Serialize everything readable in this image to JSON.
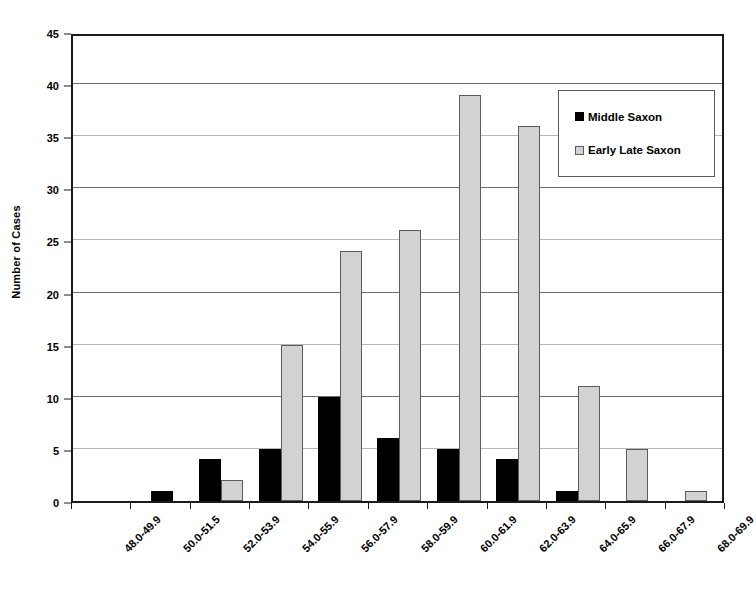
{
  "chart_data": {
    "type": "bar",
    "title": "",
    "xlabel": "",
    "ylabel": "Number of Cases",
    "ylim": [
      0,
      45
    ],
    "ytick_step": 5,
    "yticks": [
      0,
      5,
      10,
      15,
      20,
      25,
      30,
      35,
      40,
      45
    ],
    "grid": true,
    "legend_position": "top-right",
    "categories": [
      "48.0-49.9",
      "50.0-51.5",
      "52.0-53.9",
      "54.0-55.9",
      "56.0-57.9",
      "58.0-59.9",
      "60.0-61.9",
      "62.0-63.9",
      "64.0-65.9",
      "66.0-67.9",
      "68.0-69.9"
    ],
    "series": [
      {
        "name": "Middle Saxon",
        "color": "#000000",
        "values": [
          0,
          1,
          4,
          5,
          10,
          6,
          5,
          4,
          1,
          0,
          0
        ]
      },
      {
        "name": "Early Late Saxon",
        "color": "#d2d2d2",
        "values": [
          0,
          0,
          2,
          15,
          24,
          26,
          39,
          36,
          11,
          5,
          1
        ]
      }
    ]
  },
  "legend": {
    "entries": [
      {
        "label": "Middle Saxon"
      },
      {
        "label": "Early Late Saxon"
      }
    ]
  }
}
